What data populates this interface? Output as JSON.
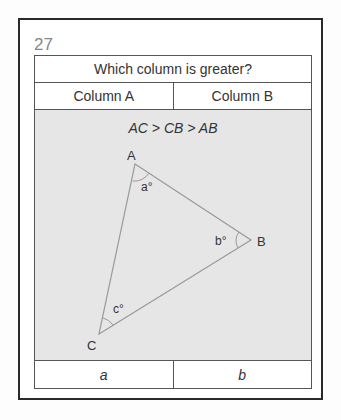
{
  "question_number": "27",
  "prompt": "Which column is greater?",
  "columns": [
    "Column A",
    "Column B"
  ],
  "condition": "AC > CB > AB",
  "figure": {
    "vertices": {
      "A": {
        "label": "A",
        "angle_label": "a°"
      },
      "B": {
        "label": "B",
        "angle_label": "b°"
      },
      "C": {
        "label": "C",
        "angle_label": "c°"
      }
    }
  },
  "answers": [
    "a",
    "b"
  ],
  "colors": {
    "figure_bg": "#e6e6e6",
    "border": "#2a2a2a",
    "line": "#888888"
  }
}
